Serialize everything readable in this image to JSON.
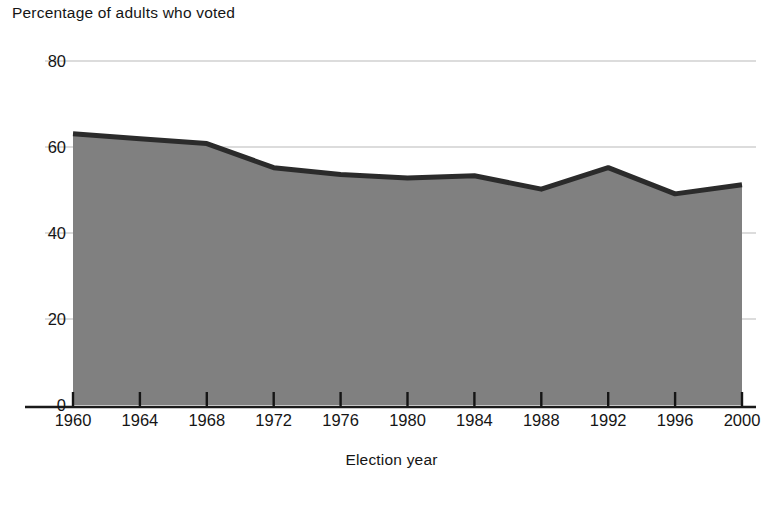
{
  "chart_data": {
    "type": "area",
    "title": "",
    "ylabel": "Percentage of adults who voted",
    "xlabel": "Election year",
    "categories": [
      1960,
      1964,
      1968,
      1972,
      1976,
      1980,
      1984,
      1988,
      1992,
      1996,
      2000
    ],
    "x_tick_labels": [
      "1960",
      "1964",
      "1968",
      "1972",
      "1976",
      "1980",
      "1984",
      "1988",
      "1992",
      "1996",
      "2000"
    ],
    "values": [
      63.1,
      61.9,
      60.8,
      55.2,
      53.6,
      52.8,
      53.3,
      50.2,
      55.2,
      49.1,
      51.2
    ],
    "series": [
      {
        "name": "Percentage of adults who voted",
        "values": [
          63.1,
          61.9,
          60.8,
          55.2,
          53.6,
          52.8,
          53.3,
          50.2,
          55.2,
          49.1,
          51.2
        ]
      }
    ],
    "y_tick_labels": [
      "0",
      "20",
      "40",
      "60",
      "80"
    ],
    "y_ticks": [
      0,
      20,
      40,
      60,
      80
    ],
    "ylim": [
      0,
      80
    ],
    "xlim": [
      1960,
      2000
    ],
    "grid": true,
    "grid_axis": "y",
    "legend": false,
    "legend_position": "none",
    "colors": {
      "area_fill": "#808080",
      "line": "#2b2b2b",
      "gridline": "#d0d0d0",
      "axis": "#1a1a1a",
      "text": "#151515",
      "background": "#ffffff"
    }
  },
  "axes": {
    "y_title": "Percentage of adults who voted",
    "x_title": "Election year",
    "y_ticks": [
      {
        "label": "80",
        "value": 80
      },
      {
        "label": "60",
        "value": 60
      },
      {
        "label": "40",
        "value": 40
      },
      {
        "label": "20",
        "value": 20
      },
      {
        "label": "0",
        "value": 0
      }
    ],
    "x_ticks": [
      {
        "label": "1960",
        "value": 1960
      },
      {
        "label": "1964",
        "value": 1964
      },
      {
        "label": "1968",
        "value": 1968
      },
      {
        "label": "1972",
        "value": 1972
      },
      {
        "label": "1976",
        "value": 1976
      },
      {
        "label": "1980",
        "value": 1980
      },
      {
        "label": "1984",
        "value": 1984
      },
      {
        "label": "1988",
        "value": 1988
      },
      {
        "label": "1992",
        "value": 1992
      },
      {
        "label": "1996",
        "value": 1996
      },
      {
        "label": "2000",
        "value": 2000
      }
    ]
  }
}
